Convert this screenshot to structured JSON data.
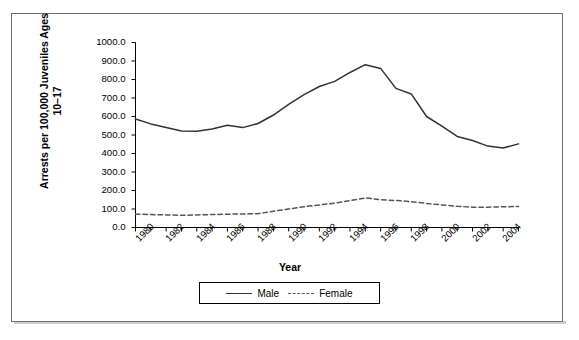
{
  "chart_data": {
    "type": "line",
    "title": "",
    "xlabel": "Year",
    "ylabel": "Arrests per 100,000 Juveniles Ages 10–17",
    "x": [
      1980,
      1981,
      1982,
      1983,
      1984,
      1985,
      1986,
      1987,
      1988,
      1989,
      1990,
      1991,
      1992,
      1993,
      1994,
      1995,
      1996,
      1997,
      1998,
      1999,
      2000,
      2001,
      2002,
      2003,
      2004,
      2005
    ],
    "xlim": [
      1980,
      2005
    ],
    "ylim": [
      0,
      1000
    ],
    "ytick_labels": [
      "0.0",
      "100.0",
      "200.0",
      "300.0",
      "400.0",
      "500.0",
      "600.0",
      "700.0",
      "800.0",
      "900.0",
      "1000.0"
    ],
    "ytick_values": [
      0,
      100,
      200,
      300,
      400,
      500,
      600,
      700,
      800,
      900,
      1000
    ],
    "xtick_labels": [
      "1980",
      "1982",
      "1984",
      "1986",
      "1988",
      "1990",
      "1992",
      "1994",
      "1996",
      "1998",
      "2000",
      "2002",
      "2004"
    ],
    "xtick_values": [
      1980,
      1982,
      1984,
      1986,
      1988,
      1990,
      1992,
      1994,
      1996,
      1998,
      2000,
      2002,
      2004
    ],
    "minor_ticks_every": 1,
    "grid": false,
    "legend_position": "bottom",
    "series": [
      {
        "name": "Male",
        "style": "solid",
        "color": "#333333",
        "values": [
          586,
          560,
          541,
          522,
          520,
          532,
          553,
          540,
          562,
          608,
          665,
          718,
          762,
          790,
          838,
          880,
          860,
          752,
          722,
          600,
          548,
          492,
          470,
          440,
          430,
          452
        ]
      },
      {
        "name": "Female",
        "style": "dashed",
        "color": "#555555",
        "values": [
          72,
          70,
          68,
          66,
          68,
          70,
          72,
          73,
          75,
          88,
          100,
          112,
          122,
          132,
          146,
          160,
          150,
          146,
          140,
          130,
          122,
          115,
          110,
          110,
          112,
          114
        ]
      }
    ]
  },
  "legend": {
    "entries": [
      {
        "label": "Male",
        "style": "solid"
      },
      {
        "label": "Female",
        "style": "dashed"
      }
    ]
  }
}
